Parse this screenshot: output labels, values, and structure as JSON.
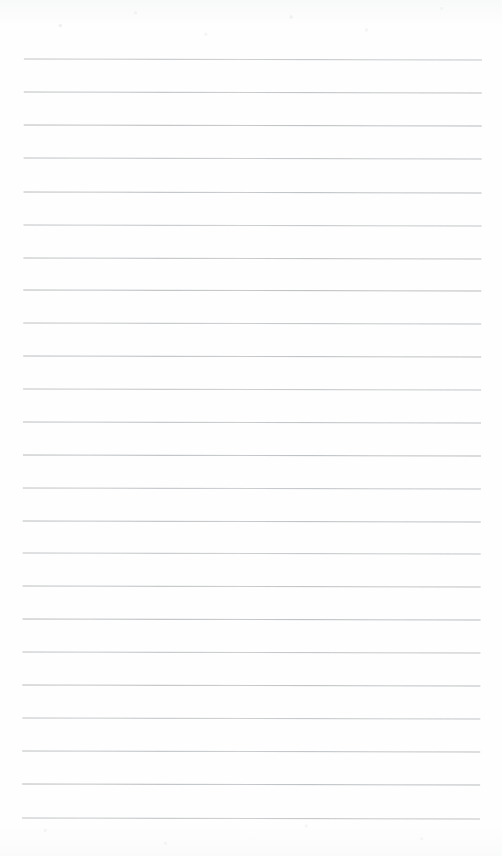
{
  "document": {
    "kind": "lined-paper-scan",
    "description": "Blank ruled notebook paper, scanned",
    "page_width": 502,
    "page_height": 856,
    "background_color": "#fefefe",
    "text_content": "",
    "handwriting_present": "no",
    "printed_text_present": "no"
  },
  "ruling": {
    "line_color": "#b2b5b8",
    "line_thickness_px": 1,
    "line_count": 24,
    "first_line_y": 59,
    "last_line_y": 818,
    "line_spacing_px": 33,
    "left_margin_x": 23,
    "right_end_x": 481,
    "line_length_px": 458,
    "skew_degrees": 0.14,
    "margin_rule_present": "no",
    "lines_y": [
      59,
      92,
      125,
      158,
      192,
      225,
      258,
      290,
      323,
      356,
      389,
      422,
      455,
      488,
      521,
      553,
      586,
      619,
      652,
      685,
      718,
      751,
      784,
      818
    ]
  }
}
